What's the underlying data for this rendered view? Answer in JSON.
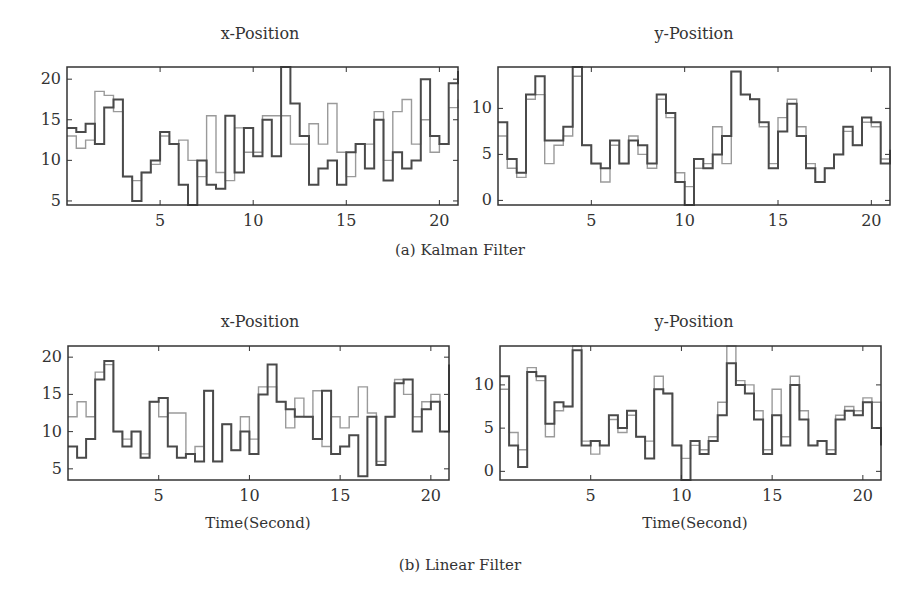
{
  "figure": {
    "captions": {
      "a": "(a) Kalman Filter",
      "b": "(b) Linear Filter"
    }
  },
  "colors": {
    "dark": "#4a4a4a",
    "light": "#9a9a9a",
    "frame": "#333333"
  },
  "chart_data": [
    {
      "type": "line",
      "panel": "(a) Kalman Filter",
      "title": "x-Position",
      "xlabel": "",
      "ylabel": "",
      "xlim": [
        0,
        21
      ],
      "ylim": [
        4.5,
        21.5
      ],
      "xticks": [
        5,
        10,
        15,
        20
      ],
      "yticks": [
        5,
        10,
        15,
        20
      ],
      "grid": false,
      "x": [
        0,
        0.5,
        1,
        1.5,
        2,
        2.5,
        3,
        3.5,
        4,
        4.5,
        5,
        5.5,
        6,
        6.5,
        7,
        7.5,
        8,
        8.5,
        9,
        9.5,
        10,
        10.5,
        11,
        11.5,
        12,
        12.5,
        13,
        13.5,
        14,
        14.5,
        15,
        15.5,
        16,
        16.5,
        17,
        17.5,
        18,
        18.5,
        19,
        19.5,
        20,
        20.5,
        21
      ],
      "series": [
        {
          "name": "dark",
          "values": [
            14,
            13.5,
            14.5,
            12,
            16.5,
            17.5,
            8,
            5,
            8.5,
            10,
            13.5,
            12,
            7,
            4.5,
            10,
            7,
            6.5,
            15.5,
            8.5,
            14,
            10.5,
            15,
            10.5,
            21.5,
            17,
            13,
            7,
            9,
            10,
            7,
            11,
            12,
            9,
            15,
            7.5,
            11,
            9,
            10,
            20,
            13,
            12,
            19.5,
            21
          ]
        },
        {
          "name": "light",
          "values": [
            13,
            11.5,
            12.5,
            18.5,
            18,
            16,
            8,
            7.5,
            8.5,
            9.5,
            13,
            12,
            12.5,
            10,
            8,
            15.5,
            8.5,
            7.5,
            14,
            11,
            11,
            15.5,
            15.5,
            15.5,
            12,
            12,
            14.5,
            12,
            17,
            11,
            8,
            12,
            12,
            16,
            10,
            16,
            17.5,
            12,
            15,
            11,
            12,
            16.5,
            17.5
          ]
        }
      ]
    },
    {
      "type": "line",
      "panel": "(a) Kalman Filter",
      "title": "y-Position",
      "xlabel": "",
      "ylabel": "",
      "xlim": [
        0,
        21
      ],
      "ylim": [
        -0.5,
        14.5
      ],
      "xticks": [
        5,
        10,
        15,
        20
      ],
      "yticks": [
        0,
        5,
        10
      ],
      "grid": false,
      "x": [
        0,
        0.5,
        1,
        1.5,
        2,
        2.5,
        3,
        3.5,
        4,
        4.5,
        5,
        5.5,
        6,
        6.5,
        7,
        7.5,
        8,
        8.5,
        9,
        9.5,
        10,
        10.5,
        11,
        11.5,
        12,
        12.5,
        13,
        13.5,
        14,
        14.5,
        15,
        15.5,
        16,
        16.5,
        17,
        17.5,
        18,
        18.5,
        19,
        19.5,
        20,
        20.5,
        21
      ],
      "series": [
        {
          "name": "dark",
          "values": [
            8.5,
            4.5,
            3,
            11.5,
            13.5,
            6.5,
            6.5,
            8,
            14.5,
            6,
            4,
            3.5,
            6.5,
            4,
            6.5,
            6,
            4,
            11.5,
            9.5,
            2,
            -0.5,
            4.5,
            3.5,
            5,
            7,
            14,
            11.5,
            11,
            8.5,
            3.5,
            7.5,
            10.5,
            7,
            3.5,
            2,
            3.5,
            5,
            8,
            6,
            9,
            8.5,
            4,
            5.5
          ]
        },
        {
          "name": "light",
          "values": [
            7,
            3.5,
            2.5,
            11,
            11.5,
            4,
            6,
            7,
            13.5,
            6,
            4,
            2,
            6,
            4,
            7,
            5,
            3.5,
            11,
            9,
            3,
            1.5,
            3.5,
            4,
            8,
            4,
            14,
            11.5,
            11,
            8,
            4,
            9,
            11,
            8,
            4,
            2,
            3.5,
            5,
            7.5,
            6,
            8.5,
            8,
            4.5,
            4.5
          ]
        }
      ]
    },
    {
      "type": "line",
      "panel": "(b) Linear Filter",
      "title": "x-Position",
      "xlabel": "Time(Second)",
      "ylabel": "",
      "xlim": [
        0,
        21
      ],
      "ylim": [
        3.5,
        21.5
      ],
      "xticks": [
        5,
        10,
        15,
        20
      ],
      "yticks": [
        5,
        10,
        15,
        20
      ],
      "grid": false,
      "x": [
        0,
        0.5,
        1,
        1.5,
        2,
        2.5,
        3,
        3.5,
        4,
        4.5,
        5,
        5.5,
        6,
        6.5,
        7,
        7.5,
        8,
        8.5,
        9,
        9.5,
        10,
        10.5,
        11,
        11.5,
        12,
        12.5,
        13,
        13.5,
        14,
        14.5,
        15,
        15.5,
        16,
        16.5,
        17,
        17.5,
        18,
        18.5,
        19,
        19.5,
        20,
        20.5,
        21
      ],
      "series": [
        {
          "name": "dark",
          "values": [
            8,
            6.5,
            9,
            17,
            19.5,
            10,
            8,
            10,
            6.5,
            14,
            14.5,
            8,
            6.5,
            7,
            6,
            15.5,
            6,
            11,
            7.5,
            10,
            7,
            15,
            19,
            14,
            13,
            12,
            12,
            9,
            15.5,
            7,
            8,
            9.5,
            4,
            12,
            5.5,
            12,
            16.5,
            17,
            10,
            13,
            14,
            10,
            19,
            21,
            18,
            15,
            8,
            8.5,
            10
          ]
        },
        {
          "name": "light",
          "values": [
            12,
            14,
            12,
            18,
            19,
            10,
            9,
            10,
            7,
            14,
            12,
            12.5,
            12.5,
            7,
            8,
            15.5,
            6,
            11,
            7.5,
            12,
            9,
            16,
            16,
            14,
            10.5,
            14.5,
            12,
            15.5,
            8,
            12,
            10.5,
            12,
            16,
            12.5,
            6,
            12,
            17,
            15,
            12,
            14,
            15,
            10,
            18,
            18,
            16,
            10,
            9,
            9
          ]
        }
      ]
    },
    {
      "type": "line",
      "panel": "(b) Linear Filter",
      "title": "y-Position",
      "xlabel": "Time(Second)",
      "ylabel": "",
      "xlim": [
        0,
        21
      ],
      "ylim": [
        -1,
        14.5
      ],
      "xticks": [
        5,
        10,
        15,
        20
      ],
      "yticks": [
        0,
        5,
        10
      ],
      "grid": false,
      "x": [
        0,
        0.5,
        1,
        1.5,
        2,
        2.5,
        3,
        3.5,
        4,
        4.5,
        5,
        5.5,
        6,
        6.5,
        7,
        7.5,
        8,
        8.5,
        9,
        9.5,
        10,
        10.5,
        11,
        11.5,
        12,
        12.5,
        13,
        13.5,
        14,
        14.5,
        15,
        15.5,
        16,
        16.5,
        17,
        17.5,
        18,
        18.5,
        19,
        19.5,
        20,
        20.5,
        21
      ],
      "series": [
        {
          "name": "dark",
          "values": [
            11,
            3,
            0.5,
            11.5,
            11,
            5.5,
            8,
            7.5,
            14,
            3,
            3.5,
            3,
            6.5,
            5,
            7,
            4,
            1.5,
            9.5,
            9,
            3,
            -1,
            3.5,
            2,
            3.5,
            6.5,
            12.5,
            10,
            9,
            6,
            2,
            6.5,
            3,
            10,
            6,
            3,
            3.5,
            2,
            6,
            7,
            6.5,
            8,
            5,
            3,
            2,
            4
          ]
        },
        {
          "name": "light",
          "values": [
            9.5,
            4.5,
            2.5,
            12,
            10.5,
            4,
            7,
            7.5,
            14.5,
            3.5,
            2,
            3,
            6,
            4.5,
            6.5,
            4,
            3.5,
            11,
            9,
            3,
            1.5,
            3,
            2.5,
            4,
            8,
            14.5,
            10.5,
            10,
            7,
            2.5,
            9.5,
            4,
            11,
            7,
            3,
            3.5,
            2.5,
            6.5,
            7.5,
            7,
            8.5,
            8,
            4,
            2.5,
            4
          ]
        }
      ]
    }
  ]
}
